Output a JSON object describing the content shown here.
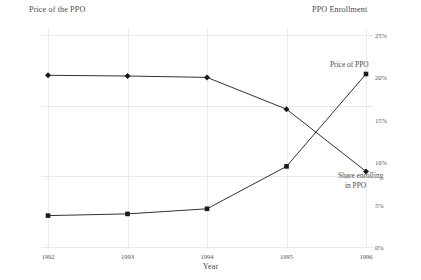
{
  "chart_data": {
    "type": "line",
    "title": "",
    "xlabel": "Year",
    "categories": [
      "1992",
      "1993",
      "1994",
      "1995",
      "1996"
    ],
    "grid": true,
    "legend_position": "inline-right",
    "axes": {
      "left": {
        "label": "Price of the PPO",
        "ticks": [
          "$0",
          "$1,000",
          "$2,000",
          "$3,000"
        ],
        "tick_values": [
          0,
          1000,
          2000,
          3000
        ],
        "ylim": [
          0,
          3000
        ]
      },
      "right": {
        "label": "PPO Enrollment",
        "ticks": [
          "0%",
          "5%",
          "10%",
          "15%",
          "20%",
          "25%"
        ],
        "tick_values": [
          0,
          5,
          10,
          15,
          20,
          25
        ],
        "ylim": [
          0,
          25
        ]
      }
    },
    "series": [
      {
        "name": "Price of PPO",
        "axis": "left",
        "marker": "diamond",
        "color": "#1a1a1a",
        "values": [
          2430,
          2420,
          2400,
          1950,
          1070
        ]
      },
      {
        "name": "Share enrolling in PPO",
        "axis": "right",
        "marker": "square",
        "color": "#1a1a1a",
        "values": [
          3.7,
          3.9,
          4.5,
          9.5,
          20.4
        ]
      }
    ],
    "annotations": [
      {
        "text": "Price of PPO",
        "target": "price-series"
      },
      {
        "text_line1": "Share enrolling",
        "text_line2": "in PPO",
        "target": "share-series"
      }
    ]
  },
  "labels": {
    "left_axis_title": "Price of the PPO",
    "right_axis_title": "PPO Enrollment",
    "x_axis_title": "Year",
    "price_inline": "Price of PPO",
    "share_inline_line1": "Share enrolling",
    "share_inline_line2": "in PPO"
  }
}
